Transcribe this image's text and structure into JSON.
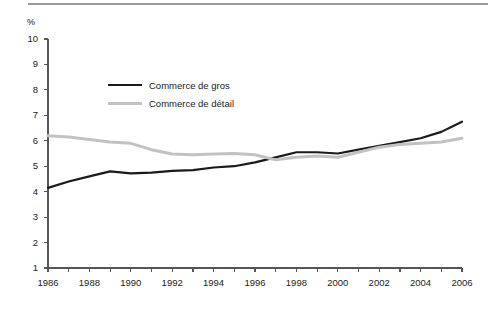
{
  "chart_data": {
    "type": "line",
    "title": "",
    "subtitle": "",
    "xlabel": "",
    "ylabel": "",
    "unit_label": "%",
    "xlim": [
      1986,
      2006
    ],
    "ylim": [
      1,
      10
    ],
    "grid": false,
    "legend_position": "inside-upper-left",
    "x": [
      1986,
      1987,
      1988,
      1989,
      1990,
      1991,
      1992,
      1993,
      1994,
      1995,
      1996,
      1997,
      1998,
      1999,
      2000,
      2001,
      2002,
      2003,
      2004,
      2005,
      2006
    ],
    "y_ticks": [
      1,
      2,
      3,
      4,
      5,
      6,
      7,
      8,
      9,
      10
    ],
    "y_tick_labels": [
      "1",
      "2",
      "3",
      "4",
      "5",
      "6",
      "7",
      "8",
      "9",
      "10"
    ],
    "x_ticks": [
      1986,
      1987,
      1988,
      1989,
      1990,
      1991,
      1992,
      1993,
      1994,
      1995,
      1996,
      1997,
      1998,
      1999,
      2000,
      2001,
      2002,
      2003,
      2004,
      2005,
      2006
    ],
    "x_tick_labels": [
      "1986",
      "",
      "1988",
      "",
      "1990",
      "",
      "1992",
      "",
      "1994",
      "",
      "1996",
      "",
      "1998",
      "",
      "2000",
      "",
      "2002",
      "",
      "2004",
      "",
      "2006"
    ],
    "x_labels_shown": [
      "1986",
      "1988",
      "1990",
      "1992",
      "1994",
      "1996",
      "1998",
      "2000",
      "2002",
      "2004",
      "2006"
    ],
    "series": [
      {
        "name": "Commerce de gros",
        "color": "#1a1a1a",
        "values": [
          4.15,
          4.4,
          4.6,
          4.8,
          4.72,
          4.75,
          4.82,
          4.85,
          4.95,
          5.0,
          5.15,
          5.35,
          5.55,
          5.55,
          5.5,
          5.65,
          5.8,
          5.95,
          6.1,
          6.35,
          6.75
        ]
      },
      {
        "name": "Commerce de détail",
        "color": "#c2c2c2",
        "values": [
          6.2,
          6.15,
          6.05,
          5.95,
          5.9,
          5.65,
          5.48,
          5.45,
          5.48,
          5.5,
          5.45,
          5.25,
          5.35,
          5.4,
          5.35,
          5.55,
          5.75,
          5.85,
          5.9,
          5.95,
          6.1
        ]
      }
    ]
  },
  "legend": {
    "items": [
      {
        "label": "Commerce de gros",
        "color": "#1a1a1a",
        "width": 2.2
      },
      {
        "label": "Commerce de détail",
        "color": "#c2c2c2",
        "width": 3.0
      }
    ]
  },
  "axis": {
    "unit_label": "%"
  },
  "colors": {
    "axis": "#555555",
    "text": "#1a1a1a",
    "rule": "#9a9a9a",
    "series_gros": "#1a1a1a",
    "series_detail": "#c2c2c2"
  }
}
